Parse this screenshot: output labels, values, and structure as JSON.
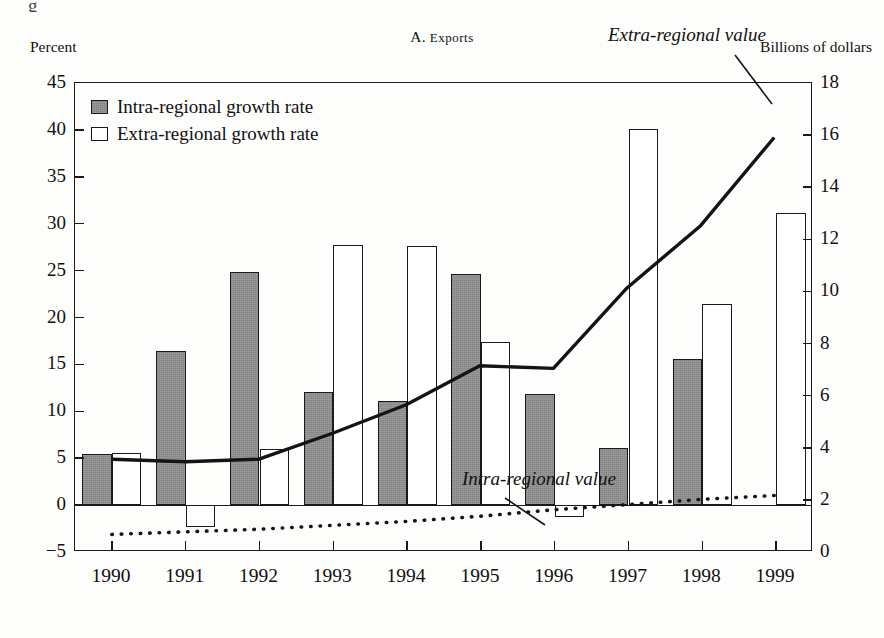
{
  "figure": {
    "cropped_caption_fragment": "g",
    "panel_title_prefix": "A. ",
    "panel_title_smallcaps": "Exports",
    "left_axis_caption": "Percent",
    "right_axis_caption": "Billions of dollars"
  },
  "legend": {
    "items": [
      {
        "label": "Intra-regional growth rate",
        "style": "filled-gray-square"
      },
      {
        "label": "Extra-regional growth rate",
        "style": "open-white-square"
      }
    ]
  },
  "annotations": [
    {
      "name": "extra-regional-value",
      "text": "Extra-regional value"
    },
    {
      "name": "intra-regional-value",
      "text": "Intra-regional value"
    }
  ],
  "axes": {
    "left": {
      "title": "Percent",
      "ticks": [
        "45",
        "40",
        "35",
        "30",
        "25",
        "20",
        "15",
        "10",
        "5",
        "0",
        "−5"
      ],
      "min": -5,
      "max": 45
    },
    "right": {
      "title": "Billions of dollars",
      "ticks": [
        "18",
        "16",
        "14",
        "12",
        "10",
        "8",
        "6",
        "4",
        "2",
        "0"
      ],
      "min": 0,
      "max": 18
    },
    "x": {
      "ticks": [
        "1990",
        "1991",
        "1992",
        "1993",
        "1994",
        "1995",
        "1996",
        "1997",
        "1998",
        "1999"
      ]
    }
  },
  "chart_data": {
    "type": "bar",
    "title": "A. Exports",
    "xlabel": "",
    "ylabel": "Percent",
    "y2label": "Billions of dollars",
    "categories": [
      "1990",
      "1991",
      "1992",
      "1993",
      "1994",
      "1995",
      "1996",
      "1997",
      "1998",
      "1999"
    ],
    "ylim": [
      -5,
      45
    ],
    "y2lim": [
      0,
      18
    ],
    "grid": false,
    "legend_position": "top-left",
    "series": [
      {
        "name": "Intra-regional growth rate",
        "type": "bar",
        "axis": "left",
        "unit": "percent",
        "values": [
          5.4,
          16.4,
          24.8,
          12.1,
          11.1,
          24.6,
          11.8,
          6.1,
          15.6,
          null
        ]
      },
      {
        "name": "Extra-regional growth rate",
        "type": "bar",
        "axis": "left",
        "unit": "percent",
        "values": [
          5.6,
          -2.3,
          6.0,
          27.7,
          27.6,
          17.4,
          -1.3,
          40.1,
          21.4,
          31.1
        ]
      },
      {
        "name": "Extra-regional value",
        "type": "line",
        "axis": "right",
        "unit": "billions of dollars",
        "values": [
          3.5,
          3.4,
          3.5,
          4.5,
          5.6,
          7.1,
          7.0,
          10.1,
          12.5,
          15.9
        ]
      },
      {
        "name": "Intra-regional value",
        "type": "dotted-line",
        "axis": "right",
        "unit": "billions of dollars",
        "values": [
          0.6,
          0.7,
          0.8,
          0.95,
          1.1,
          1.3,
          1.55,
          1.75,
          1.95,
          2.1
        ]
      }
    ]
  }
}
